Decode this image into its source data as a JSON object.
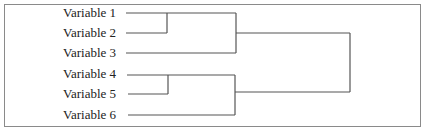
{
  "diagram": {
    "type": "dendrogram",
    "leaves": [
      {
        "label": "Variable 1",
        "y": 13
      },
      {
        "label": "Variable 2",
        "y": 33
      },
      {
        "label": "Variable 3",
        "y": 53
      },
      {
        "label": "Variable 4",
        "y": 75
      },
      {
        "label": "Variable 5",
        "y": 94
      },
      {
        "label": "Variable 6",
        "y": 115
      }
    ],
    "merges": [
      {
        "members": [
          "Variable 1",
          "Variable 2"
        ],
        "x": 167
      },
      {
        "members": [
          "Variable 4",
          "Variable 5"
        ],
        "x": 168
      },
      {
        "members": [
          "Variable 1",
          "Variable 2",
          "Variable 3"
        ],
        "x": 236
      },
      {
        "members": [
          "Variable 4",
          "Variable 5",
          "Variable 6"
        ],
        "x": 235
      },
      {
        "members": [
          "Variable 1",
          "Variable 2",
          "Variable 3",
          "Variable 4",
          "Variable 5",
          "Variable 6"
        ],
        "x": 350
      }
    ],
    "colors": {
      "line": "#555555",
      "border": "#8a8a8a",
      "text": "#222222"
    }
  }
}
